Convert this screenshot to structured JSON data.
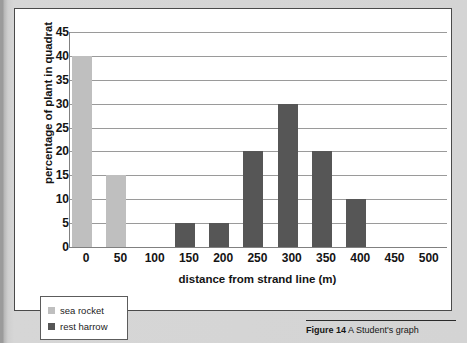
{
  "page": {
    "top_sliver_text": "",
    "background_color": "#d4d4d4",
    "panel_background": "#ffffff"
  },
  "figure": {
    "number_label": "Figure 14",
    "caption_text": " A Student's graph"
  },
  "legend": {
    "items": [
      {
        "label": "sea rocket",
        "color": "#bfbfbf"
      },
      {
        "label": "rest harrow",
        "color": "#565656"
      }
    ]
  },
  "chart_data": {
    "type": "bar",
    "title": "",
    "xlabel": "distance from strand line (m)",
    "ylabel": "percentage of plant in quadrat",
    "categories": [
      "0",
      "50",
      "100",
      "150",
      "200",
      "250",
      "300",
      "350",
      "400",
      "450",
      "500"
    ],
    "ylim": [
      0,
      45
    ],
    "yticks": [
      45,
      40,
      35,
      30,
      25,
      20,
      15,
      10,
      5,
      0
    ],
    "grid": true,
    "legend_position": "below-left",
    "series": [
      {
        "name": "sea rocket",
        "color": "#bfbfbf",
        "values": [
          40,
          15,
          0,
          0,
          0,
          0,
          0,
          0,
          0,
          0,
          0
        ]
      },
      {
        "name": "rest harrow",
        "color": "#565656",
        "values": [
          0,
          0,
          0,
          5,
          5,
          20,
          30,
          20,
          10,
          0,
          0
        ]
      }
    ],
    "bars": [
      {
        "category": "0",
        "value": 40,
        "series": "sea rocket"
      },
      {
        "category": "50",
        "value": 15,
        "series": "sea rocket"
      },
      {
        "category": "100",
        "value": 0,
        "series": "none"
      },
      {
        "category": "150",
        "value": 5,
        "series": "rest harrow"
      },
      {
        "category": "200",
        "value": 5,
        "series": "rest harrow"
      },
      {
        "category": "250",
        "value": 20,
        "series": "rest harrow"
      },
      {
        "category": "300",
        "value": 30,
        "series": "rest harrow"
      },
      {
        "category": "350",
        "value": 20,
        "series": "rest harrow"
      },
      {
        "category": "400",
        "value": 10,
        "series": "rest harrow"
      },
      {
        "category": "450",
        "value": 0,
        "series": "none"
      },
      {
        "category": "500",
        "value": 0,
        "series": "none"
      }
    ]
  }
}
